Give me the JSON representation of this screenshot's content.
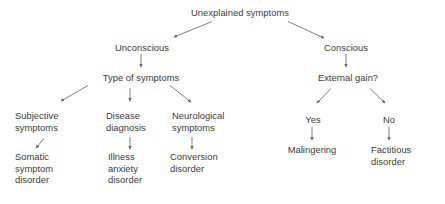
{
  "diagram": {
    "type": "flowchart",
    "background_color": "#ffffff",
    "text_color": "#3a3a3a",
    "arrow_color": "#6b6b6b",
    "width": 445,
    "height": 204
  },
  "nodes": {
    "root": "Unexplained symptoms",
    "unconscious": "Unconscious",
    "conscious": "Conscious",
    "type_of_symptoms": "Type of symptoms",
    "external_gain": "External gain?",
    "subjective_symptoms": "Subjective\nsymptoms",
    "disease_diagnosis": "Disease\ndiagnosis",
    "neurological_symptoms": "Neurological\nsymptoms",
    "yes": "Yes",
    "no": "No",
    "somatic_symptom_disorder": "Somatic\nsymptom\ndisorder",
    "illness_anxiety_disorder": "Illness\nanxiety\ndisorder",
    "conversion_disorder": "Conversion\ndisorder",
    "malingering": "Malingering",
    "factitious_disorder": "Factitious\ndisorder"
  },
  "edges": [
    {
      "name": "root-to-unconscious",
      "from": "root",
      "to": "unconscious"
    },
    {
      "name": "root-to-conscious",
      "from": "root",
      "to": "conscious"
    },
    {
      "name": "unconscious-to-type",
      "from": "unconscious",
      "to": "type_of_symptoms"
    },
    {
      "name": "conscious-to-external-gain",
      "from": "conscious",
      "to": "external_gain"
    },
    {
      "name": "type-to-subjective",
      "from": "type_of_symptoms",
      "to": "subjective_symptoms"
    },
    {
      "name": "type-to-disease",
      "from": "type_of_symptoms",
      "to": "disease_diagnosis"
    },
    {
      "name": "type-to-neurological",
      "from": "type_of_symptoms",
      "to": "neurological_symptoms"
    },
    {
      "name": "external-gain-to-yes",
      "from": "external_gain",
      "to": "yes"
    },
    {
      "name": "external-gain-to-no",
      "from": "external_gain",
      "to": "no"
    },
    {
      "name": "subjective-to-somatic",
      "from": "subjective_symptoms",
      "to": "somatic_symptom_disorder"
    },
    {
      "name": "disease-to-illness-anxiety",
      "from": "disease_diagnosis",
      "to": "illness_anxiety_disorder"
    },
    {
      "name": "neurological-to-conversion",
      "from": "neurological_symptoms",
      "to": "conversion_disorder"
    },
    {
      "name": "yes-to-malingering",
      "from": "yes",
      "to": "malingering"
    },
    {
      "name": "no-to-factitious",
      "from": "no",
      "to": "factitious_disorder"
    }
  ]
}
